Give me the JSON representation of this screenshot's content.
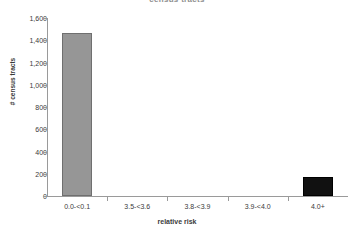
{
  "chart_data": {
    "type": "bar",
    "title": "census tracts",
    "xlabel": "relative risk",
    "ylabel": "# census tracts",
    "categories": [
      "0.0-<0.1",
      "3.5-<3.6",
      "3.8-<3.9",
      "3.9-<4.0",
      "4.0+"
    ],
    "values": [
      1465,
      0,
      0,
      0,
      170
    ],
    "bar_colors": [
      "#969696",
      "#969696",
      "#969696",
      "#969696",
      "#111111"
    ],
    "ylim": [
      0,
      1600
    ],
    "yticks": [
      0,
      200,
      400,
      600,
      800,
      1000,
      1200,
      1400,
      1600
    ],
    "ytick_labels": [
      "0",
      "200",
      "400",
      "600",
      "800",
      "1,000",
      "1,200",
      "1,400",
      "1,600"
    ],
    "grid": false,
    "legend": false
  },
  "style": {
    "background": "#ffffff",
    "axis_color": "#9a9a9a",
    "text_color": "#3b3b3b",
    "title_color": "#8e8e8e"
  }
}
